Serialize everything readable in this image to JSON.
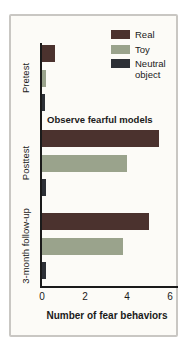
{
  "window": {
    "background": "#ffffff"
  },
  "card": {
    "background": "#fcfbf7",
    "border_color": "#c9c7c3"
  },
  "chart_data": {
    "type": "bar",
    "orientation": "horizontal",
    "xlabel": "Number of fear behaviors",
    "x_ticks": [
      "0",
      "2",
      "4",
      "6"
    ],
    "xlim": [
      0,
      6.5
    ],
    "grid": false,
    "legend_position": "top-right",
    "legend": [
      "Real",
      "Toy",
      "Neutral object"
    ],
    "series_colors": {
      "Real": "#4b322e",
      "Toy": "#9aa38c",
      "Neutral object": "#2d3036"
    },
    "categories": [
      "Pretest",
      "Posttest",
      "3-month follow-up"
    ],
    "series": [
      {
        "name": "Real",
        "values": [
          0.6,
          5.5,
          5.0
        ]
      },
      {
        "name": "Toy",
        "values": [
          0.2,
          4.0,
          3.8
        ]
      },
      {
        "name": "Neutral object",
        "values": [
          0.15,
          0.2,
          0.2
        ]
      }
    ],
    "annotation": {
      "text": "Observe fearful models",
      "target_group": "Posttest"
    },
    "axis_color": "#1a1a1a",
    "text_color": "#1a1a1a"
  }
}
